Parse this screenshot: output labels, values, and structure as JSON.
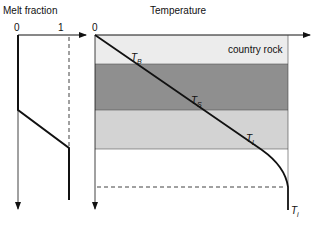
{
  "left_panel": {
    "title": "Melt fraction",
    "axis_min": "0",
    "axis_max": "1"
  },
  "right_panel": {
    "title": "Temperature",
    "origin": "0",
    "layer_label": "country rock",
    "band_colors": {
      "country_rock_top": "#ececec",
      "dark_layer": "#8f8f8f",
      "light_layer": "#d3d3d3",
      "below": "#ffffff"
    },
    "curve_labels": [
      {
        "main": "T",
        "sub": "B"
      },
      {
        "main": "T",
        "sub": "S"
      },
      {
        "main": "T",
        "sub": "L"
      },
      {
        "main": "T",
        "sub": "i"
      }
    ]
  }
}
